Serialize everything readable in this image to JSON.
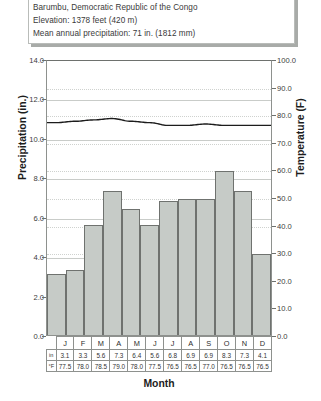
{
  "info": {
    "location": "Barumbu, Democratic Republic of the Congo",
    "elevation": "Elevation: 1378 feet (420 m)",
    "precipitation": "Mean annual precipitation: 71 in. (1812 mm)"
  },
  "chart_data": {
    "type": "bar",
    "title": "",
    "xlabel": "Month",
    "ylabel": "Precipitation (in.)",
    "ylabel_secondary": "Temperature (F)",
    "categories": [
      "J",
      "F",
      "M",
      "A",
      "M",
      "J",
      "J",
      "A",
      "S",
      "O",
      "N",
      "D"
    ],
    "ylim": [
      0.0,
      14.0
    ],
    "yticks": [
      "0.0",
      "2.0",
      "4.0",
      "6.0",
      "8.0",
      "10.0",
      "12.0",
      "14.0"
    ],
    "ylim_secondary": [
      0.0,
      100.0
    ],
    "yticks_secondary": [
      "0.0",
      "10.0",
      "20.0",
      "30.0",
      "40.0",
      "50.0",
      "60.0",
      "70.0",
      "80.0",
      "90.0",
      "100.0"
    ],
    "grid": true,
    "legend": "none",
    "series": [
      {
        "name": "Precipitation",
        "unit": "in",
        "kind": "bar",
        "axis": "left",
        "color": "#c6cbc7",
        "values": [
          3.1,
          3.3,
          5.6,
          7.3,
          6.4,
          5.6,
          6.8,
          6.9,
          6.9,
          8.3,
          7.3,
          4.1
        ]
      },
      {
        "name": "Temperature",
        "unit": "°F",
        "kind": "line",
        "axis": "right",
        "color": "#1c1c1c",
        "values": [
          77.5,
          78.0,
          78.5,
          79.0,
          78.0,
          77.5,
          76.5,
          76.5,
          77.0,
          76.5,
          76.5,
          76.5
        ]
      }
    ]
  },
  "table": {
    "row_labels": [
      "in",
      "°F"
    ],
    "months": [
      "J",
      "F",
      "M",
      "A",
      "M",
      "J",
      "J",
      "A",
      "S",
      "O",
      "N",
      "D"
    ],
    "precipitation": [
      "3.1",
      "3.3",
      "5.6",
      "7.3",
      "6.4",
      "5.6",
      "6.8",
      "6.9",
      "6.9",
      "8.3",
      "7.3",
      "4.1"
    ],
    "temperature": [
      "77.5",
      "78.0",
      "78.5",
      "79.0",
      "78.0",
      "77.5",
      "76.5",
      "76.5",
      "77.0",
      "76.5",
      "76.5",
      "76.5"
    ]
  }
}
